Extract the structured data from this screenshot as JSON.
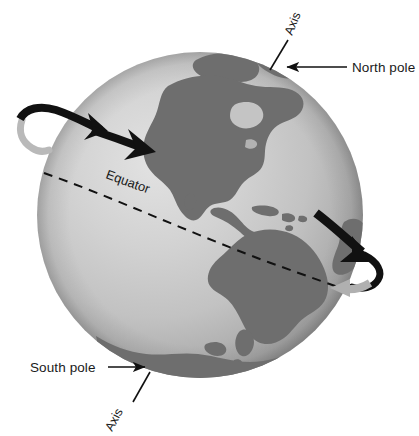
{
  "figure": {
    "kind": "earth-rotation-diagram",
    "background_color": "#ffffff"
  },
  "globe": {
    "ocean_color_light": "#d8d8d8",
    "ocean_color_mid": "#b6b6b6",
    "ocean_color_dark": "#8e8e8e",
    "land_color": "#6e6e6e",
    "center_x": 200,
    "center_y": 215,
    "radius": 163
  },
  "labels": {
    "north_pole": "North pole",
    "south_pole": "South pole",
    "equator": "Equator",
    "axis_top": "Axis",
    "axis_bottom": "Axis"
  },
  "annotations": {
    "equator_line_style": "dashed",
    "equator_line_color": "#111111",
    "leader_line_color": "#111111",
    "arrow_black_color": "#111111",
    "arrow_gray_color": "#a8a8a8"
  },
  "rotation_arrows": {
    "top_arrow_direction": "eastward",
    "bottom_arrow_direction": "eastward"
  },
  "landmasses": [
    "North America",
    "South America",
    "Central America",
    "Caribbean islands",
    "Greenland",
    "Antarctica"
  ]
}
